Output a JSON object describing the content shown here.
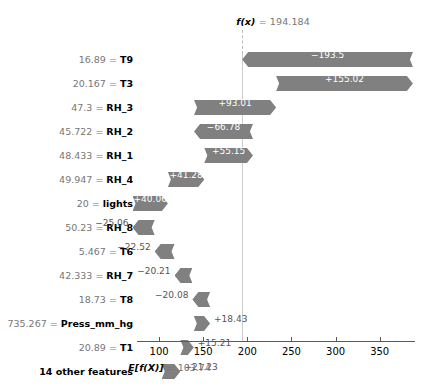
{
  "chart_data": {
    "type": "bar",
    "chart_kind": "shap-waterfall",
    "title": "",
    "xlabel": "",
    "ylabel": "",
    "base_value": 103.74,
    "base_value_label": "E[f(X)] = 103.74",
    "base_value_prefix": "E[f(X)]",
    "base_value_equals": "=",
    "base_value_text": "103.74",
    "prediction_value": 194.184,
    "prediction_label": "f(x) = 194.184",
    "prediction_prefix": "f(x)",
    "prediction_equals": "=",
    "prediction_text": "194.184",
    "xlim": [
      75,
      390
    ],
    "xticks": [
      100,
      150,
      200,
      250,
      300,
      350
    ],
    "xticklabels": [
      "100",
      "150",
      "200",
      "250",
      "300",
      "350"
    ],
    "grid": false,
    "bar_color": "#808080",
    "categories": [
      "16.89 = T9",
      "20.167 = T3",
      "47.3 = RH_3",
      "45.722 = RH_2",
      "48.433 = RH_1",
      "49.947 = RH_4",
      "20 = lights",
      "50.23 = RH_8",
      "5.467 = T6",
      "42.333 = RH_7",
      "18.73 = T8",
      "735.267 = Press_mm_hg",
      "20.89 = T1",
      "14 other features"
    ],
    "values": [
      -193.5,
      155.02,
      93.01,
      -66.78,
      55.15,
      41.28,
      40.06,
      -25.06,
      -22.52,
      -20.21,
      -20.08,
      18.43,
      15.21,
      21.23
    ],
    "rows": [
      {
        "feature_value": "16.89",
        "feature_name": "T9",
        "shap": -193.5,
        "shap_label": "−193.5",
        "label_inside": true
      },
      {
        "feature_value": "20.167",
        "feature_name": "T3",
        "shap": 155.02,
        "shap_label": "+155.02",
        "label_inside": true
      },
      {
        "feature_value": "47.3",
        "feature_name": "RH_3",
        "shap": 93.01,
        "shap_label": "+93.01",
        "label_inside": true
      },
      {
        "feature_value": "45.722",
        "feature_name": "RH_2",
        "shap": -66.78,
        "shap_label": "−66.78",
        "label_inside": true
      },
      {
        "feature_value": "48.433",
        "feature_name": "RH_1",
        "shap": 55.15,
        "shap_label": "+55.15",
        "label_inside": true
      },
      {
        "feature_value": "49.947",
        "feature_name": "RH_4",
        "shap": 41.28,
        "shap_label": "+41.28",
        "label_inside": true
      },
      {
        "feature_value": "20",
        "feature_name": "lights",
        "shap": 40.06,
        "shap_label": "+40.06",
        "label_inside": true
      },
      {
        "feature_value": "50.23",
        "feature_name": "RH_8",
        "shap": -25.06,
        "shap_label": "−25.06",
        "label_inside": false
      },
      {
        "feature_value": "5.467",
        "feature_name": "T6",
        "shap": -22.52,
        "shap_label": "−22.52",
        "label_inside": false
      },
      {
        "feature_value": "42.333",
        "feature_name": "RH_7",
        "shap": -20.21,
        "shap_label": "−20.21",
        "label_inside": false
      },
      {
        "feature_value": "18.73",
        "feature_name": "T8",
        "shap": -20.08,
        "shap_label": "−20.08",
        "label_inside": false
      },
      {
        "feature_value": "735.267",
        "feature_name": "Press_mm_hg",
        "shap": 18.43,
        "shap_label": "+18.43",
        "label_inside": false
      },
      {
        "feature_value": "20.89",
        "feature_name": "T1",
        "shap": 15.21,
        "shap_label": "+15.21",
        "label_inside": false
      },
      {
        "feature_value": "",
        "feature_name": "14 other features",
        "shap": 21.23,
        "shap_label": "+21.23",
        "label_inside": false
      }
    ],
    "separator": "="
  }
}
